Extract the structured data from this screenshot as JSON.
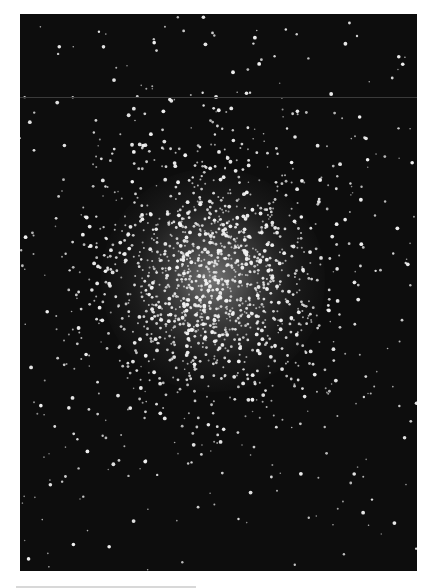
{
  "image": {
    "subject": "globular star cluster",
    "description": "Black-and-white astronomical photograph of a dense globular star cluster centered slightly above middle, with scattered field stars across a dark sky background",
    "background_color": "#0d0d0d",
    "page_color": "#ffffff",
    "star_color": "#f2f2f2",
    "frame": {
      "x": 20,
      "y": 14,
      "width": 397,
      "height": 557
    },
    "cluster_center": {
      "x": 213,
      "y": 280
    },
    "core_radius": 70,
    "halo_radius": 160,
    "artifacts": [
      "faint horizontal scan line near top",
      "light gray bar at bottom-left margin"
    ]
  },
  "render": {
    "seed": 1337,
    "field_stars": 260,
    "cluster_stars": 1400
  }
}
